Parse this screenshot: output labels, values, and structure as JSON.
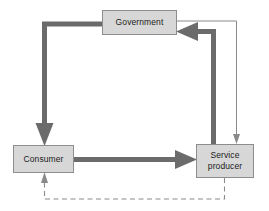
{
  "diagram": {
    "type": "flow-diagram",
    "canvas": {
      "width": 269,
      "height": 211,
      "background": "#ffffff"
    },
    "palette": {
      "node_fill": "#d7d7d7",
      "node_border": "#8d8d8d",
      "thick_arrow": "#6b6b6b",
      "thin_arrow": "#8a8a8a",
      "dashed_arrow": "#8a8a8a",
      "text": "#1b1b1b"
    },
    "nodes": [
      {
        "id": "government",
        "label": "Government"
      },
      {
        "id": "consumer",
        "label": "Consumer"
      },
      {
        "id": "service_producer",
        "label": "Service\nproducer"
      }
    ],
    "edges": [
      {
        "id": "gov-to-consumer",
        "from": "government",
        "to": "consumer",
        "style": "thick-solid",
        "arrowhead": "large"
      },
      {
        "id": "consumer-to-producer",
        "from": "consumer",
        "to": "service_producer",
        "style": "thick-solid",
        "arrowhead": "large"
      },
      {
        "id": "producer-to-gov",
        "from": "service_producer",
        "to": "government",
        "style": "thick-solid",
        "arrowhead": "large"
      },
      {
        "id": "gov-to-producer",
        "from": "government",
        "to": "service_producer",
        "style": "thin-solid",
        "arrowhead": "small"
      },
      {
        "id": "producer-to-consumer",
        "from": "service_producer",
        "to": "consumer",
        "style": "thin-dashed",
        "arrowhead": "small"
      }
    ]
  }
}
